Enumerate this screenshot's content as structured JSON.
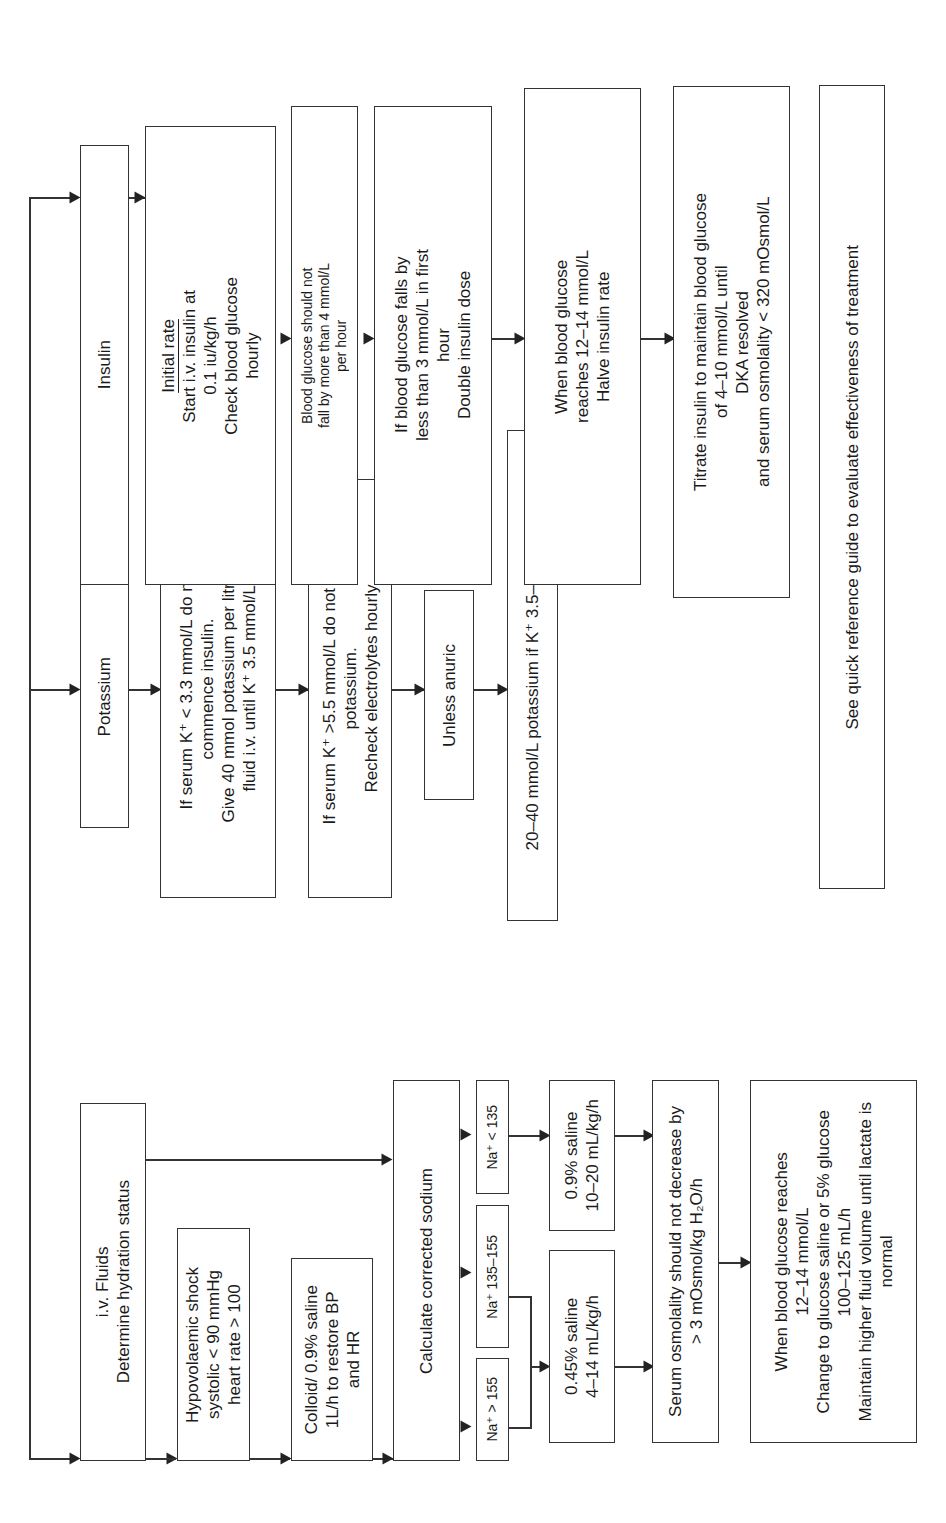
{
  "fluids": {
    "header": "i.v. Fluids\nDetermine hydration status",
    "shock": "Hypovolaemic shock\nsystolic < 90 mmHg\nheart rate > 100",
    "colloid": "Colloid/ 0.9% saline\n1L/h to restore BP\nand HR",
    "calc_sodium": "Calculate corrected sodium",
    "na_high": "Na⁺ > 155",
    "na_mid": "Na⁺ 135–155",
    "na_low": "Na⁺ < 135",
    "saline_045": "0.45% saline\n4–14 mL/kg/h",
    "saline_09": "0.9% saline\n10–20 mL/kg/h",
    "osmolality": "Serum osmolality should not decrease by\n> 3 mOsmol/kg H₂O/h",
    "glucose_reaches": "When blood glucose reaches\n12–14 mmol/L\nChange to glucose saline or 5% glucose\n100–125 mL/h\nMaintain higher fluid volume until lactate is\nnormal"
  },
  "potassium": {
    "header": "Potassium",
    "low_k": "If serum K⁺ < 3.3 mmol/L do not\ncommence insulin.\nGive 40 mmol potassium per litre of\nfluid i.v. until K⁺ 3.5 mmol/L",
    "high_k": "If serum K⁺ >5.5 mmol/L do not give\npotassium.\nRecheck electrolytes hourly",
    "unless_anuric": "Unless anuric",
    "normal_k": "20–40 mmol/L potassium if K⁺ 3.5–5.5 mmol/L"
  },
  "insulin": {
    "header": "Insulin",
    "initial_rate_title": "Initial rate",
    "initial_rate": "Start i.v. insulin at\n0.1 iu/kg/h\nCheck blood glucose\nhourly",
    "fall_limit": "Blood glucose should not\nfall by more than 4 mmol/L\nper hour",
    "double_dose": "If blood glucose falls by\nless than 3 mmol/L in first\nhour\nDouble insulin dose",
    "halve_rate": "When blood glucose\nreaches 12–14 mmol/L\nHalve insulin rate",
    "titrate": "Titrate insulin to maintain blood glucose\nof 4–10 mmol/L until\nDKA resolved\nand serum osmolality < 320 mOsmol/L"
  },
  "footer": "See quick reference guide to evaluate effectiveness of treatment"
}
